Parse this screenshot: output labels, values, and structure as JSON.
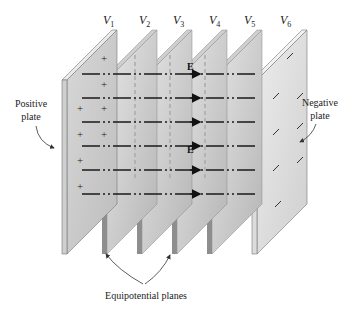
{
  "figure": {
    "voltage_labels": [
      {
        "base": "V",
        "sub": "1"
      },
      {
        "base": "V",
        "sub": "2"
      },
      {
        "base": "V",
        "sub": "3"
      },
      {
        "base": "V",
        "sub": "4"
      },
      {
        "base": "V",
        "sub": "5"
      },
      {
        "base": "V",
        "sub": "6"
      }
    ],
    "positive_plate_label": [
      "Positive",
      "plate"
    ],
    "negative_plate_label": [
      "Negative",
      "plate"
    ],
    "equipotential_label": "Equipotential planes",
    "field_label": "E",
    "positive_charge_symbol": "+",
    "negative_charge_symbol": "−",
    "field_line_count": 6,
    "equipotential_plane_count": 4,
    "colors": {
      "plate_face": "#c9c9c9",
      "plate_edge": "#e2e2e2",
      "plane_face": "#d4d4d4",
      "plane_shadow": "#9a9a9a",
      "field_line": "#1a1a1a",
      "text": "#222222"
    }
  }
}
